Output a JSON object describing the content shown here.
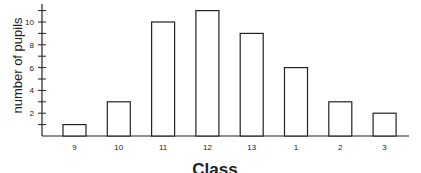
{
  "chart_data": {
    "type": "bar",
    "title": "",
    "xlabel": "Class",
    "ylabel": "number of pupils",
    "categories": [
      "9",
      "10",
      "11",
      "12",
      "13",
      "1",
      "2",
      "3"
    ],
    "values": [
      1,
      3,
      10,
      11,
      9,
      6,
      3,
      2
    ],
    "ylim": [
      0,
      12
    ],
    "yticks_labeled": [
      2,
      4,
      6,
      8,
      10
    ],
    "yticks_minor_step": 1,
    "grid": false,
    "legend": null,
    "bar_fill": "#ffffff",
    "bar_stroke": "#222222"
  }
}
